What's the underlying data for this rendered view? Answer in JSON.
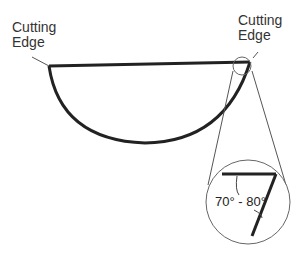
{
  "diagram": {
    "labels": {
      "left": [
        "Cutting",
        "Edge"
      ],
      "right": [
        "Cutting",
        "Edge"
      ]
    },
    "angle_label": "70° - 80°",
    "colors": {
      "stroke": "#222222",
      "thin": "#555555",
      "text": "#333333"
    }
  }
}
